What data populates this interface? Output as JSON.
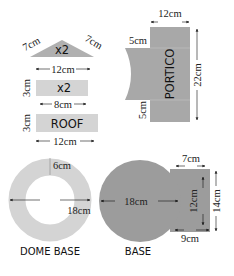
{
  "colors": {
    "light_piece": "#d4d4d4",
    "dark_piece": "#9c9c9c",
    "mid_piece": "#b3b3b3",
    "text": "#111111"
  },
  "pieces": {
    "roof_triangle": {
      "label": "x2",
      "side_left": "7cm",
      "side_right": "7cm",
      "base": "12cm"
    },
    "roof_small": {
      "label": "x2",
      "height": "3cm",
      "width": "8cm"
    },
    "roof": {
      "label": "ROOF",
      "height": "3cm",
      "width": "12cm"
    },
    "portico": {
      "label": "PORTICO",
      "top_width": "12cm",
      "tab_top": "5cm",
      "tab_bottom": "5cm",
      "height": "22cm"
    },
    "dome_base": {
      "label": "DOME BASE",
      "ring_width": "6cm",
      "diameter": "18cm"
    },
    "base": {
      "label": "BASE",
      "diameter": "18cm",
      "tab_top": "7cm",
      "tab_inner_height": "12cm",
      "tab_outer_height": "14cm",
      "tab_bottom": "9cm"
    }
  }
}
